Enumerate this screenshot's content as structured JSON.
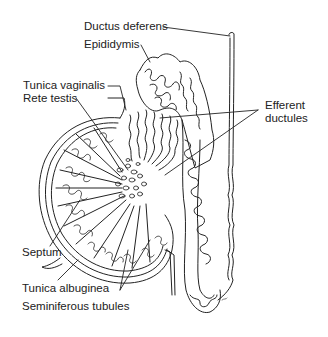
{
  "diagram": {
    "labels": [
      {
        "id": "ductus-deferens",
        "text": "Ductus deferens"
      },
      {
        "id": "epididymis",
        "text": "Epididymis"
      },
      {
        "id": "tunica-vaginalis",
        "text": "Tunica vaginalis"
      },
      {
        "id": "rete-testis",
        "text": "Rete testis"
      },
      {
        "id": "efferent-ductules-1",
        "text": "Efferent"
      },
      {
        "id": "efferent-ductules-2",
        "text": "ductules"
      },
      {
        "id": "septum",
        "text": "Septum"
      },
      {
        "id": "tunica-albuginea",
        "text": "Tunica albuginea"
      },
      {
        "id": "seminiferous-tubules",
        "text": "Seminiferous tubules"
      }
    ],
    "colors": {
      "line": "#222222",
      "background": "#ffffff"
    }
  }
}
